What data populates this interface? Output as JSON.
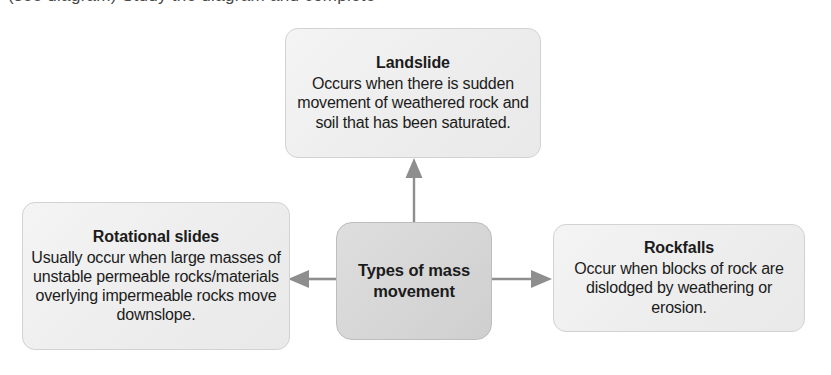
{
  "page": {
    "background_color": "#ffffff",
    "clipped_top_line": "(see diagram) Study the diagram and complete"
  },
  "diagram": {
    "type": "concept-map",
    "center": {
      "id": "types-of-mass-movement",
      "title": "Types of mass",
      "title_line2": "movement",
      "fill_color": "#d8d8d8",
      "border_color": "#bdbdbd"
    },
    "nodes": [
      {
        "id": "landslide",
        "position": "top",
        "title": "Landslide",
        "body": "Occurs when there is sudden movement of weathered rock and soil that has been saturated.",
        "fill_color": "#f0f0f0",
        "border_color": "#d2d2d2"
      },
      {
        "id": "rotational-slides",
        "position": "left",
        "title": "Rotational slides",
        "body": "Usually occur when large masses of unstable permeable rocks/materials overlying impermeable rocks move downslope.",
        "fill_color": "#f0f0f0",
        "border_color": "#d2d2d2"
      },
      {
        "id": "rockfalls",
        "position": "right",
        "title": "Rockfalls",
        "body": "Occur when blocks of rock are dislodged by weathering or erosion.",
        "fill_color": "#f0f0f0",
        "border_color": "#d2d2d2"
      }
    ],
    "arrows": [
      {
        "id": "arrow-up",
        "from": "types-of-mass-movement",
        "to": "landslide",
        "direction": "up",
        "color": "#8e8e8e"
      },
      {
        "id": "arrow-left",
        "from": "types-of-mass-movement",
        "to": "rotational-slides",
        "direction": "left",
        "color": "#8e8e8e"
      },
      {
        "id": "arrow-right",
        "from": "types-of-mass-movement",
        "to": "rockfalls",
        "direction": "right",
        "color": "#8e8e8e"
      }
    ]
  }
}
